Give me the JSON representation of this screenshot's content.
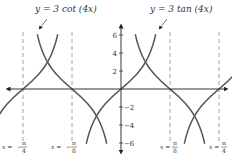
{
  "chart_data": {
    "type": "line",
    "title": "",
    "xlabel": "",
    "ylabel": "",
    "xlim": [
      -0.785,
      0.785
    ],
    "ylim": [
      -6,
      6
    ],
    "grid": false,
    "series": [
      {
        "name": "y = 3 cot (4x)",
        "function": "3*cot(4x)",
        "label": "y = 3 cot (4x)"
      },
      {
        "name": "y = 3 tan (4x)",
        "function": "3*tan(4x)",
        "label": "y = 3 tan (4x)"
      }
    ],
    "yticks": [
      6,
      4,
      2,
      -2,
      -4,
      -6
    ],
    "ytick_labels": [
      "6",
      "4",
      "2",
      "−2",
      "−4",
      "−6"
    ],
    "asymptotes": [
      {
        "x": -0.7854,
        "label_lhs": "x =",
        "label_num": "π",
        "label_den": "4",
        "sign": "−"
      },
      {
        "x": -0.3927,
        "label_lhs": "x =",
        "label_num": "π",
        "label_den": "8",
        "sign": "−"
      },
      {
        "x": 0.3927,
        "label_lhs": "x =",
        "label_num": "π",
        "label_den": "8",
        "sign": ""
      },
      {
        "x": 0.7854,
        "label_lhs": "x =",
        "label_num": "π",
        "label_den": "4",
        "sign": ""
      }
    ],
    "colors": {
      "curve": "#555555",
      "axis": "#333333",
      "asymptote": "#888888"
    }
  }
}
